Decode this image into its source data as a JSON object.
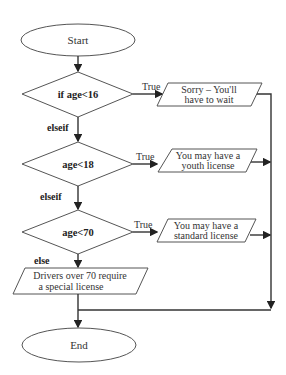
{
  "flowchart": {
    "start": "Start",
    "end": "End",
    "decisions": [
      {
        "condition": "if age<16",
        "branch_label": "True",
        "next_label": "elseif",
        "output_line1": "Sorry – You'll",
        "output_line2": "have to wait"
      },
      {
        "condition": "age<18",
        "branch_label": "True",
        "next_label": "elseif",
        "output_line1": "You may have a",
        "output_line2": "youth license"
      },
      {
        "condition": "age<70",
        "branch_label": "True",
        "next_label": "else",
        "output_line1": "You may have a",
        "output_line2": "standard license"
      }
    ],
    "else_output_line1": "Drivers over 70 require",
    "else_output_line2": "a special license"
  },
  "colors": {
    "stroke": "#555555",
    "line": "#333333",
    "background": "#ffffff"
  }
}
